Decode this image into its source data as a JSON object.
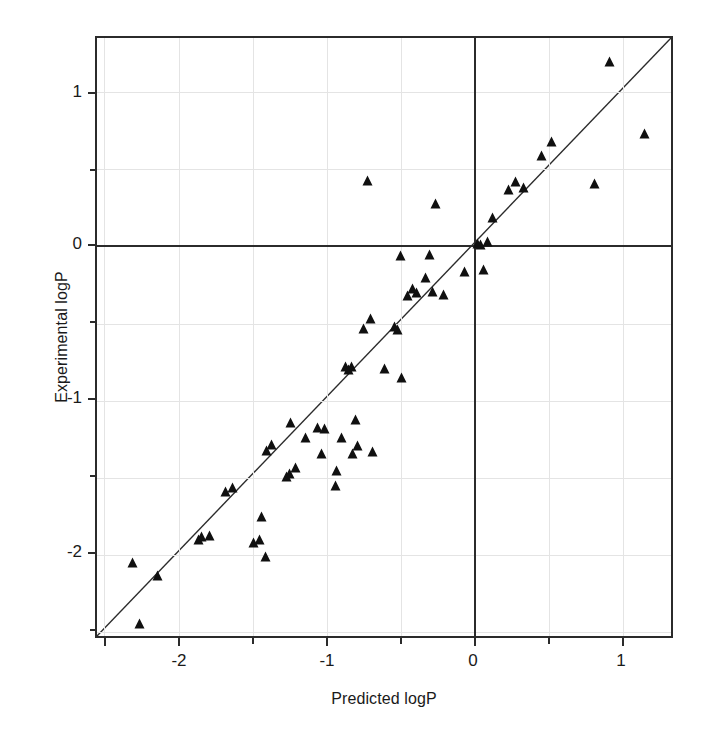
{
  "figure": {
    "title": "",
    "background": "#ffffff",
    "marker_color": "#101010",
    "line_color": "#2b2b2b",
    "grid_color": "#e4e4e4"
  },
  "axes": {
    "xlabel": "Predicted logP",
    "ylabel": "Experimental logP",
    "x_ticklabels": [
      "-2",
      "-1",
      "0",
      "1"
    ],
    "y_ticklabels": [
      "1",
      "0",
      "-1",
      "-2"
    ]
  },
  "chart_data": {
    "type": "scatter",
    "title": "",
    "xlabel": "Predicted logP",
    "ylabel": "Experimental logP",
    "xlim": [
      -2.55,
      1.35
    ],
    "ylim": [
      -2.55,
      1.35
    ],
    "xticks": [
      -2,
      -1,
      0,
      1
    ],
    "yticks": [
      1,
      0,
      -1,
      -2
    ],
    "xminorticks": [
      -2.5,
      -1.5,
      -0.5,
      0.5
    ],
    "yminorticks": [
      -2.5,
      -1.5,
      -0.5,
      0.5
    ],
    "grid": true,
    "legend": null,
    "marker": "triangle",
    "reference_line": {
      "name": "identity-line",
      "type": "line",
      "slope": 1,
      "intercept": 0,
      "x": [
        -2.55,
        1.35
      ],
      "y": [
        -2.55,
        1.35
      ]
    },
    "series": [
      {
        "name": "logP points",
        "points": [
          [
            -2.31,
            -2.06
          ],
          [
            -2.26,
            -2.45
          ],
          [
            -2.14,
            -2.14
          ],
          [
            -1.86,
            -1.91
          ],
          [
            -1.84,
            -1.89
          ],
          [
            -1.79,
            -1.88
          ],
          [
            -1.68,
            -1.6
          ],
          [
            -1.63,
            -1.57
          ],
          [
            -1.49,
            -1.93
          ],
          [
            -1.45,
            -1.91
          ],
          [
            -1.44,
            -1.76
          ],
          [
            -1.41,
            -2.02
          ],
          [
            -1.4,
            -1.33
          ],
          [
            -1.37,
            -1.29
          ],
          [
            -1.27,
            -1.5
          ],
          [
            -1.25,
            -1.48
          ],
          [
            -1.24,
            -1.15
          ],
          [
            -1.21,
            -1.44
          ],
          [
            -1.14,
            -1.25
          ],
          [
            -1.06,
            -1.18
          ],
          [
            -1.03,
            -1.35
          ],
          [
            -1.01,
            -1.19
          ],
          [
            -0.94,
            -1.56
          ],
          [
            -0.93,
            -1.46
          ],
          [
            -0.9,
            -1.25
          ],
          [
            -0.87,
            -0.79
          ],
          [
            -0.85,
            -0.81
          ],
          [
            -0.83,
            -0.79
          ],
          [
            -0.82,
            -1.35
          ],
          [
            -0.8,
            -1.13
          ],
          [
            -0.79,
            -1.3
          ],
          [
            -0.75,
            -0.54
          ],
          [
            -0.72,
            0.42
          ],
          [
            -0.7,
            -0.48
          ],
          [
            -0.69,
            -1.34
          ],
          [
            -0.61,
            -0.8
          ],
          [
            -0.54,
            -0.53
          ],
          [
            -0.52,
            -0.55
          ],
          [
            -0.5,
            -0.07
          ],
          [
            -0.49,
            -0.86
          ],
          [
            -0.45,
            -0.33
          ],
          [
            -0.42,
            -0.28
          ],
          [
            -0.39,
            -0.31
          ],
          [
            -0.33,
            -0.21
          ],
          [
            -0.3,
            -0.06
          ],
          [
            -0.28,
            -0.3
          ],
          [
            -0.26,
            0.27
          ],
          [
            -0.21,
            -0.32
          ],
          [
            -0.07,
            -0.17
          ],
          [
            0.02,
            0.01
          ],
          [
            0.04,
            0.0
          ],
          [
            0.06,
            -0.16
          ],
          [
            0.09,
            0.02
          ],
          [
            0.12,
            0.18
          ],
          [
            0.23,
            0.36
          ],
          [
            0.28,
            0.41
          ],
          [
            0.33,
            0.37
          ],
          [
            0.45,
            0.58
          ],
          [
            0.52,
            0.67
          ],
          [
            0.81,
            0.4
          ],
          [
            0.91,
            1.19
          ],
          [
            1.15,
            0.72
          ]
        ]
      }
    ]
  }
}
